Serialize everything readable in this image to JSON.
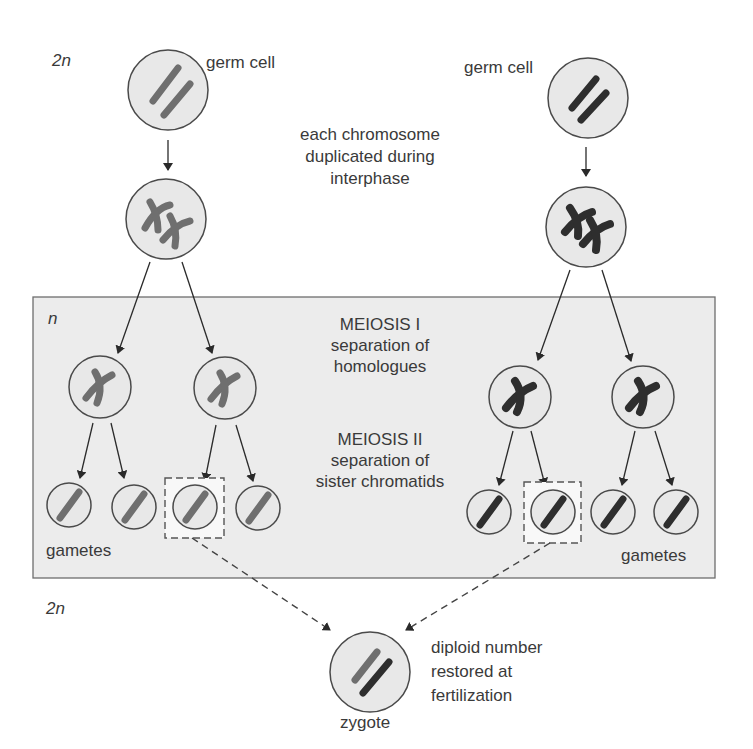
{
  "diagram": {
    "colors": {
      "background": "#ffffff",
      "meiosis_box_fill": "#ececec",
      "meiosis_box_border": "#6e6e6e",
      "cell_fill": "#e8e8e8",
      "cell_border": "#4a4a4a",
      "maternal_chromosome": "#6f6f6f",
      "paternal_chromosome": "#2e2e2e",
      "arrow": "#2a2a2a"
    },
    "ploidy_labels": {
      "top": "2n",
      "box": "n",
      "bottom": "2n"
    },
    "labels": {
      "germ_cell_left": "germ cell",
      "germ_cell_right": "germ cell",
      "duplication_note": [
        "each chromosome",
        "duplicated during",
        "interphase"
      ],
      "meiosis1_title": "MEIOSIS I",
      "meiosis1_desc": [
        "separation of",
        "homologues"
      ],
      "meiosis2_title": "MEIOSIS II",
      "meiosis2_desc": [
        "separation of",
        "sister chromatids"
      ],
      "gametes_left": "gametes",
      "gametes_right": "gametes",
      "zygote": "zygote",
      "fertilization_note": [
        "diploid number",
        "restored at",
        "fertilization"
      ]
    },
    "stages": [
      {
        "name": "germ cells",
        "ploidy": "2n",
        "cells": 2
      },
      {
        "name": "duplicated chromosomes",
        "ploidy": "2n",
        "cells": 2
      },
      {
        "name": "after meiosis I",
        "ploidy": "n",
        "cells": 4
      },
      {
        "name": "gametes after meiosis II",
        "ploidy": "n",
        "cells": 8
      },
      {
        "name": "zygote",
        "ploidy": "2n",
        "cells": 1
      }
    ],
    "highlighted_gametes": [
      "left lineage, 3rd gamete",
      "right lineage, 2nd gamete"
    ]
  }
}
